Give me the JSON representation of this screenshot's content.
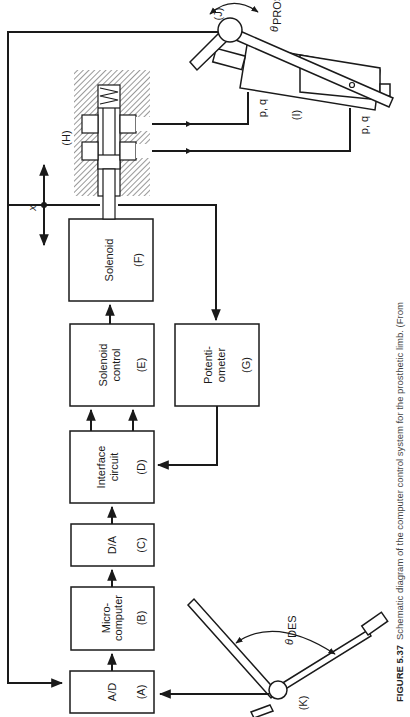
{
  "figure": {
    "caption_label": "FIGURE 5.37",
    "caption_text": "Schematic diagram of the computer control system for the prosthetic limb. (From",
    "orientation": "rotated 90° counter-clockwise"
  },
  "blocks": {
    "A": {
      "line1": "A/D",
      "line2": "",
      "tag": "(A)"
    },
    "B": {
      "line1": "Micro-",
      "line2": "computer",
      "tag": "(B)"
    },
    "C": {
      "line1": "D/A",
      "line2": "",
      "tag": "(C)"
    },
    "D": {
      "line1": "Interface",
      "line2": "circuit",
      "tag": "(D)"
    },
    "E": {
      "line1": "Solenoid",
      "line2": "control",
      "tag": "(E)"
    },
    "F": {
      "line1": "Solenoid",
      "line2": "",
      "tag": "(F)"
    },
    "G": {
      "line1": "Potenti-",
      "line2": "ometer",
      "tag": "(G)"
    }
  },
  "labels": {
    "valve": "(H)",
    "actuator": "(I)",
    "prosthetic_joint": "(J)",
    "desired_joint": "(K)",
    "displacement": "x",
    "pq_top": "p, q",
    "pq_bottom": "p, q",
    "theta_pros": "θ",
    "theta_pros_sub": "PROS",
    "theta_des": "θ",
    "theta_des_sub": "DES"
  },
  "colors": {
    "ink": "#1a1a1a",
    "background": "#ffffff",
    "caption": "#444444"
  }
}
